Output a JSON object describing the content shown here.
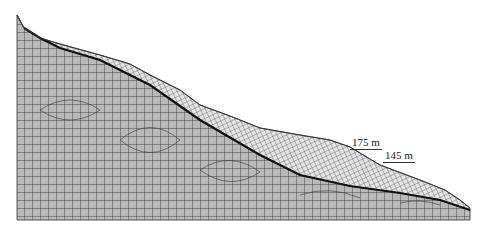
{
  "figure": {
    "type": "finite-element mesh of slope cross-section",
    "colors": {
      "background": "#ffffff",
      "bedrock_fill": "#b9b9b9",
      "bedrock_grid": "#2e2e2e",
      "slide_fill": "#e4e4e4",
      "slide_grid": "#3a3a3a",
      "slip_surface": "#111111"
    },
    "labels": [
      {
        "id": "label-175",
        "text": "175 m",
        "x": 350,
        "y": 136
      },
      {
        "id": "label-145",
        "text": "145 m",
        "x": 383,
        "y": 149
      }
    ],
    "geometry": {
      "mesh_left": 17,
      "mesh_right": 470,
      "mesh_bottom": 220,
      "ground_surface": [
        [
          17,
          15
        ],
        [
          24,
          28
        ],
        [
          40,
          38
        ],
        [
          60,
          44
        ],
        [
          100,
          55
        ],
        [
          130,
          64
        ],
        [
          150,
          75
        ],
        [
          180,
          90
        ],
        [
          200,
          105
        ],
        [
          230,
          116
        ],
        [
          260,
          128
        ],
        [
          300,
          135
        ],
        [
          330,
          140
        ],
        [
          350,
          147
        ],
        [
          380,
          165
        ],
        [
          420,
          180
        ],
        [
          445,
          190
        ],
        [
          460,
          200
        ],
        [
          470,
          208
        ]
      ],
      "slip_surface": [
        [
          24,
          28
        ],
        [
          40,
          38
        ],
        [
          60,
          48
        ],
        [
          100,
          60
        ],
        [
          150,
          85
        ],
        [
          200,
          120
        ],
        [
          260,
          155
        ],
        [
          300,
          175
        ],
        [
          350,
          186
        ],
        [
          400,
          193
        ],
        [
          440,
          200
        ],
        [
          470,
          210
        ]
      ]
    }
  }
}
